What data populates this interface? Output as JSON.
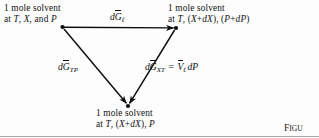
{
  "figure": {
    "type": "thermodynamic-cycle-diagram",
    "background_color": "#fdfdfd",
    "ink_color": "#0d0d0d",
    "caption_prefix": "Figu",
    "caption_big": "F",
    "caption_small": "IGU"
  },
  "nodes": {
    "top_left": {
      "line1": "1 mole solvent",
      "line2_prefix": "at ",
      "line2": "at T, X, and P",
      "vars": [
        "T",
        "X",
        "P"
      ]
    },
    "top_right": {
      "line1": "1 mole solvent",
      "line2": "at T, (X+dX), (P+dP)"
    },
    "bottom": {
      "line1": "1 mole solvent",
      "line2": "at T, (X+dX), P"
    }
  },
  "arrows": {
    "top": {
      "label_d": "d",
      "label_G": "G",
      "label_sub": "ℓ",
      "label_full": "dḠℓ",
      "from": "top_left",
      "to": "top_right"
    },
    "left": {
      "label_d": "d",
      "label_G": "G",
      "label_sub": "TP",
      "label_full": "dḠTP",
      "from": "top_left",
      "to": "bottom"
    },
    "right": {
      "label_d": "d",
      "label_G": "G",
      "label_sub": "XT",
      "equals": "=",
      "rhs_V": "V",
      "rhs_sub": "ℓ",
      "rhs_tail": "dP",
      "label_full": "dḠXT = V̄ℓ dP",
      "from": "top_right",
      "to": "bottom"
    }
  },
  "geometry": {
    "top_left_vertex": [
      62,
      27
    ],
    "top_right_vertex": [
      176,
      28
    ],
    "bottom_vertex": [
      128,
      106
    ]
  }
}
